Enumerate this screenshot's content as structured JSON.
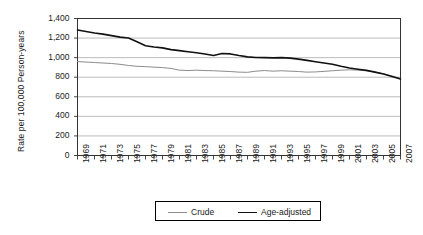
{
  "chart_data": {
    "type": "line",
    "title": "",
    "xlabel": "",
    "ylabel": "Rate per 100,000 Person-years",
    "ylim": [
      0,
      1400
    ],
    "xlim": [
      1969,
      2007
    ],
    "grid": true,
    "legend_position": "bottom",
    "ytick_labels": [
      "1,400",
      "1,200",
      "1,000",
      "800",
      "600",
      "400",
      "200",
      "0"
    ],
    "ytick_values": [
      1400,
      1200,
      1000,
      800,
      600,
      400,
      200,
      0
    ],
    "x": [
      1969,
      1970,
      1971,
      1972,
      1973,
      1974,
      1975,
      1976,
      1977,
      1978,
      1979,
      1980,
      1981,
      1982,
      1983,
      1984,
      1985,
      1986,
      1987,
      1988,
      1989,
      1990,
      1991,
      1992,
      1993,
      1994,
      1995,
      1996,
      1997,
      1998,
      1999,
      2000,
      2001,
      2002,
      2003,
      2004,
      2005,
      2006,
      2007
    ],
    "xtick_labels": [
      "1969",
      "1971",
      "1973",
      "1975",
      "1977",
      "1979",
      "1981",
      "1983",
      "1985",
      "1987",
      "1989",
      "1991",
      "1993",
      "1995",
      "1997",
      "1999",
      "2001",
      "2003",
      "2005",
      "2007"
    ],
    "xtick_values": [
      1969,
      1971,
      1973,
      1975,
      1977,
      1979,
      1981,
      1983,
      1985,
      1987,
      1989,
      1991,
      1993,
      1995,
      1997,
      1999,
      2001,
      2003,
      2005,
      2007
    ],
    "series": [
      {
        "name": "Crude",
        "color": "#8c8c8c",
        "width": 1.0,
        "values": [
          960,
          955,
          950,
          945,
          940,
          932,
          920,
          912,
          908,
          903,
          898,
          890,
          872,
          868,
          872,
          868,
          866,
          862,
          858,
          852,
          850,
          862,
          868,
          862,
          866,
          862,
          858,
          852,
          854,
          860,
          866,
          872,
          876,
          872,
          866,
          852,
          836,
          812,
          788
        ]
      },
      {
        "name": "Age-adjusted",
        "color": "#111111",
        "width": 1.6,
        "values": [
          1282,
          1268,
          1252,
          1240,
          1225,
          1210,
          1200,
          1162,
          1122,
          1108,
          1100,
          1082,
          1072,
          1060,
          1050,
          1038,
          1022,
          1042,
          1038,
          1022,
          1008,
          1002,
          1000,
          998,
          1000,
          995,
          985,
          972,
          958,
          945,
          932,
          912,
          895,
          882,
          870,
          852,
          832,
          808,
          782
        ]
      }
    ]
  },
  "legend": {
    "entries": [
      {
        "label": "Crude"
      },
      {
        "label": "Age-adjusted"
      }
    ]
  },
  "axes": {
    "y_title": "Rate per 100,000 Person-years"
  },
  "colors": {
    "crude": "#8c8c8c",
    "age_adjusted": "#111111",
    "grid": "#b3b3b3",
    "frame": "#333333"
  }
}
